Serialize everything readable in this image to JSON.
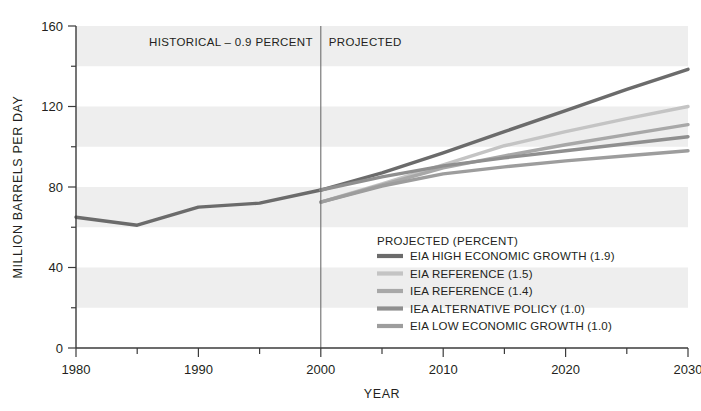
{
  "chart_data": {
    "type": "line",
    "title": "",
    "xlabel": "YEAR",
    "ylabel": "MILLION BARRELS PER DAY",
    "xlim": [
      1980,
      2030
    ],
    "ylim": [
      0,
      160
    ],
    "x_ticks": [
      1980,
      1985,
      1990,
      1995,
      2000,
      2005,
      2010,
      2015,
      2020,
      2025,
      2030
    ],
    "x_tick_labels": [
      "1980",
      "",
      "1990",
      "",
      "2000",
      "",
      "2010",
      "",
      "2020",
      "",
      "2030"
    ],
    "y_ticks": [
      0,
      20,
      40,
      60,
      80,
      100,
      120,
      140,
      160
    ],
    "y_tick_labels": [
      "0",
      "",
      "40",
      "",
      "80",
      "",
      "120",
      "",
      "160"
    ],
    "grid": false,
    "banded_background": true,
    "band_color": "#eeeeee",
    "band_ranges": [
      [
        20,
        40
      ],
      [
        60,
        80
      ],
      [
        100,
        120
      ],
      [
        140,
        160
      ]
    ],
    "divider_x": 2000,
    "annotations": [
      {
        "text": "HISTORICAL – 0.9 PERCENT",
        "x": 1991.4,
        "y": 152
      },
      {
        "text": "PROJECTED",
        "x": 2004.6,
        "y": 152
      }
    ],
    "legend_position": "inside-lower-right",
    "legend_title": "PROJECTED (PERCENT)",
    "series": [
      {
        "name": "HISTORICAL",
        "label": "",
        "color": "#6b6b6b",
        "in_legend": false,
        "x": [
          1980,
          1985,
          1990,
          1995,
          2000
        ],
        "values": [
          65,
          61,
          70,
          72,
          78.5
        ]
      },
      {
        "name": "EIA HIGH ECONOMIC GROWTH (1.9)",
        "label": "EIA HIGH ECONOMIC GROWTH (1.9)",
        "color": "#6b6b6b",
        "in_legend": true,
        "x": [
          2000,
          2005,
          2010,
          2015,
          2020,
          2025,
          2030
        ],
        "values": [
          78.5,
          87,
          97,
          107.5,
          118,
          128.5,
          138.5
        ]
      },
      {
        "name": "EIA REFERENCE (1.5)",
        "label": "EIA REFERENCE (1.5)",
        "color": "#c4c4c4",
        "in_legend": true,
        "x": [
          2000,
          2005,
          2010,
          2015,
          2020,
          2025,
          2030
        ],
        "values": [
          72.5,
          81.5,
          91,
          100.5,
          107.5,
          114,
          120
        ]
      },
      {
        "name": "IEA REFERENCE (1.4)",
        "label": "IEA REFERENCE (1.4)",
        "color": "#a8a8a8",
        "in_legend": true,
        "x": [
          2000,
          2005,
          2010,
          2015,
          2020,
          2025,
          2030
        ],
        "values": [
          72.5,
          81,
          89.5,
          95.5,
          101,
          106,
          111
        ]
      },
      {
        "name": "IEA ALTERNATIVE POLICY (1.0)",
        "label": "IEA ALTERNATIVE POLICY (1.0)",
        "color": "#8f8f8f",
        "in_legend": true,
        "x": [
          2000,
          2005,
          2010,
          2015,
          2020,
          2025,
          2030
        ],
        "values": [
          78.5,
          85,
          90.5,
          94.5,
          98,
          101.5,
          105
        ]
      },
      {
        "name": "EIA LOW ECONOMIC GROWTH (1.0)",
        "label": "EIA LOW ECONOMIC GROWTH (1.0)",
        "color": "#9d9d9d",
        "in_legend": true,
        "x": [
          2000,
          2005,
          2010,
          2015,
          2020,
          2025,
          2030
        ],
        "values": [
          72.5,
          80.5,
          86.5,
          90,
          93,
          95.5,
          98
        ]
      }
    ]
  },
  "legend": {
    "title": "PROJECTED (PERCENT)",
    "items": [
      {
        "label": "EIA HIGH ECONOMIC GROWTH (1.9)",
        "color": "#6b6b6b"
      },
      {
        "label": "EIA REFERENCE (1.5)",
        "color": "#c4c4c4"
      },
      {
        "label": "IEA REFERENCE (1.4)",
        "color": "#a8a8a8"
      },
      {
        "label": "IEA ALTERNATIVE POLICY (1.0)",
        "color": "#8f8f8f"
      },
      {
        "label": "EIA LOW ECONOMIC GROWTH (1.0)",
        "color": "#9d9d9d"
      }
    ]
  },
  "axes": {
    "x_title": "YEAR",
    "y_title": "MILLION BARRELS PER DAY",
    "x_labels": [
      "1980",
      "1990",
      "2000",
      "2010",
      "2020",
      "2030"
    ],
    "y_labels": [
      "0",
      "40",
      "80",
      "120",
      "160"
    ]
  },
  "regions": {
    "historical_label": "HISTORICAL – 0.9 PERCENT",
    "projected_label": "PROJECTED"
  },
  "colors": {
    "text": "#231f20",
    "axis": "#3b3b3b",
    "band": "#eeeeee",
    "divider": "#6d6d6d",
    "background": "#ffffff"
  }
}
